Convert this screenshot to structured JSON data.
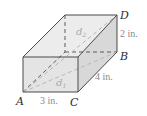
{
  "figure": {
    "type": "rectangular-prism",
    "vertices": {
      "A": "A",
      "B": "B",
      "C": "C",
      "D": "D"
    },
    "dimensions": {
      "length": "3 in.",
      "width": "4 in.",
      "height": "2 in."
    },
    "diagonals": {
      "d1": {
        "letter": "d",
        "subscript": "1"
      },
      "d2": {
        "letter": "d",
        "subscript": "2"
      }
    },
    "colors": {
      "edge": "#4a4a4a",
      "face_front": "#e2e2e2",
      "face_top": "#ececec",
      "face_right": "#d6d6d6",
      "hidden_edge": "#5a5a5a",
      "diagonal": "#b8b8b8"
    }
  }
}
